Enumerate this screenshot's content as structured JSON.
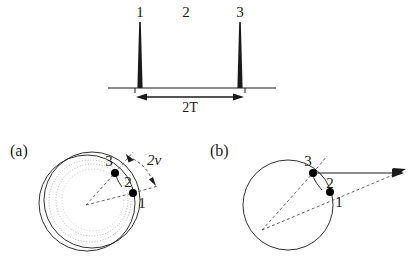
{
  "figure": {
    "title_present": false,
    "background_color": "#ffffff",
    "line_color": "#1a1a1a",
    "dot_color": "#000000",
    "dotted_circle_color": "#9a9a9a"
  },
  "pulse_sequence": {
    "name": "spin-echo-pulse-sequence",
    "baseline_label": "",
    "pulses": [
      {
        "id": "pulse-1",
        "label": "1",
        "x": 140
      },
      {
        "id": "pulse-3",
        "label": "3",
        "x": 240
      }
    ],
    "interval_label": "2",
    "duration_label": "2T",
    "duration_arrow": {
      "from_x": 140,
      "to_x": 240
    }
  },
  "panel_a": {
    "label": "(a)",
    "points": [
      {
        "label": "1"
      },
      {
        "label": "2"
      },
      {
        "label": "3"
      }
    ],
    "angle_label": "2v",
    "description_hidden": "decaying spiral precession"
  },
  "panel_b": {
    "label": "(b)",
    "points": [
      {
        "label": "1"
      },
      {
        "label": "2"
      },
      {
        "label": "3"
      }
    ],
    "description_hidden": "single circle with vector arrows"
  }
}
